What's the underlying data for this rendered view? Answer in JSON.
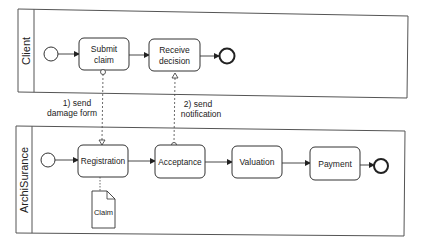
{
  "diagram": {
    "type": "BPMN collaboration",
    "pools": [
      {
        "name": "Client",
        "elements": {
          "start": "start-event",
          "tasks": [
            "Submit claim",
            "Receive decision"
          ],
          "end": "end-event"
        }
      },
      {
        "name": "ArchiSurance",
        "elements": {
          "start": "start-event",
          "tasks": [
            "Registration",
            "Acceptance",
            "Valuation",
            "Payment"
          ],
          "end": "end-event"
        },
        "data_objects": [
          "Claim"
        ]
      }
    ],
    "messages": [
      {
        "line1": "1) send",
        "line2": "damage form",
        "from": "Submit claim",
        "to": "Registration"
      },
      {
        "line1": "2) send",
        "line2": "notification",
        "from": "Acceptance",
        "to": "Receive decision"
      }
    ],
    "labels": {
      "client_pool": "Client",
      "insurer_pool": "ArchiSurance",
      "submit_claim_l1": "Submit",
      "submit_claim_l2": "claim",
      "receive_decision_l1": "Receive",
      "receive_decision_l2": "decision",
      "registration": "Registration",
      "acceptance": "Acceptance",
      "valuation": "Valuation",
      "payment": "Payment",
      "claim_doc": "Claim",
      "msg1_l1": "1) send",
      "msg1_l2": "damage form",
      "msg2_l1": "2) send",
      "msg2_l2": "notification"
    },
    "colors": {
      "stroke": "#333333",
      "text": "#222222",
      "background": "#ffffff"
    }
  }
}
